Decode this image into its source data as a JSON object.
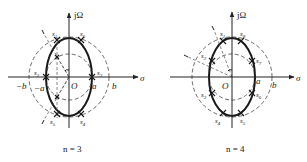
{
  "figure": {
    "panels": [
      {
        "id": "n3",
        "caption": "n = 3",
        "axes": {
          "x_label": "σ",
          "y_label": "jΩ",
          "origin_label": "O"
        },
        "tick_labels": {
          "neg_b": "−b",
          "neg_a": "−a",
          "pos_a": "a",
          "pos_b": "b"
        },
        "poles": [
          "s1",
          "s2",
          "s3",
          "s4",
          "s5",
          "s6"
        ],
        "pole_labels": {
          "s1": "s",
          "s1_sub": "1",
          "s2": "s",
          "s2_sub": "2",
          "s3": "s",
          "s3_sub": "3",
          "s4": "s",
          "s4_sub": "4",
          "s5": "s",
          "s5_sub": "5",
          "s6": "s",
          "s6_sub": "6"
        }
      },
      {
        "id": "n4",
        "caption": "n = 4",
        "axes": {
          "x_label": "σ",
          "y_label": "jΩ",
          "origin_label": "O"
        },
        "tick_labels": {
          "pos_a": "a",
          "pos_b": "b"
        },
        "poles": [
          "s1",
          "s2",
          "s3",
          "s4",
          "s5",
          "s6",
          "s7",
          "s8"
        ],
        "pole_labels": {
          "s1": "s",
          "s1_sub": "1",
          "s2": "s",
          "s2_sub": "2",
          "s3": "s",
          "s3_sub": "3",
          "s4": "s",
          "s4_sub": "4",
          "s5": "s",
          "s5_sub": "5",
          "s6": "s",
          "s6_sub": "6",
          "s7": "s",
          "s7_sub": "7",
          "s8": "s",
          "s8_sub": "8"
        }
      }
    ]
  }
}
